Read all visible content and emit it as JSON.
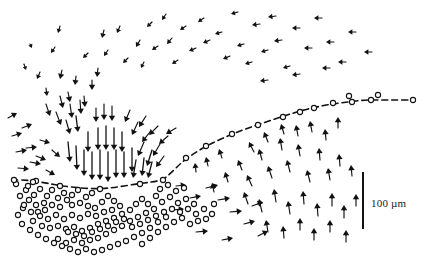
{
  "figure": {
    "kind": "vector-field-diagram",
    "background_color": "#ffffff",
    "ink_color": "#111111",
    "width": 425,
    "height": 275
  },
  "scale_bar": {
    "label": "100 µm",
    "value": 100,
    "unit": "µm",
    "orientation": "vertical",
    "x": 363,
    "y_top": 172,
    "y_bottom": 229,
    "thickness": 2,
    "label_x": 371,
    "label_y": 205,
    "color": "#111111"
  },
  "dashed_curve": {
    "name": "boundary-curve",
    "stroke": "#111111",
    "stroke_width": 1.6,
    "dash_pattern": "6 4",
    "points": [
      [
        12,
        180
      ],
      [
        28,
        180
      ],
      [
        46,
        183
      ],
      [
        62,
        186
      ],
      [
        80,
        188
      ],
      [
        100,
        189
      ],
      [
        118,
        187
      ],
      [
        136,
        184
      ],
      [
        152,
        182
      ],
      [
        163,
        180
      ],
      [
        172,
        172
      ],
      [
        182,
        162
      ],
      [
        196,
        152
      ],
      [
        212,
        143
      ],
      [
        230,
        135
      ],
      [
        248,
        128
      ],
      [
        266,
        122
      ],
      [
        284,
        116
      ],
      [
        300,
        111
      ],
      [
        316,
        107
      ],
      [
        332,
        104
      ],
      [
        348,
        102
      ],
      [
        364,
        100
      ],
      [
        380,
        100
      ],
      [
        396,
        100
      ],
      [
        414,
        100
      ]
    ]
  },
  "circles": {
    "name": "cell-markers",
    "stroke": "#111111",
    "stroke_width": 1.1,
    "fill": "#ffffff",
    "radius": 2.6,
    "count": 132,
    "on_curve": [
      [
        14,
        180
      ],
      [
        33,
        182
      ],
      [
        60,
        186
      ],
      [
        100,
        189
      ],
      [
        140,
        184
      ],
      [
        163,
        180
      ],
      [
        186,
        158
      ],
      [
        206,
        146
      ],
      [
        232,
        134
      ],
      [
        258,
        125
      ],
      [
        283,
        117
      ],
      [
        300,
        112
      ],
      [
        314,
        108
      ],
      [
        333,
        103
      ],
      [
        349,
        96
      ],
      [
        352,
        102
      ],
      [
        371,
        100
      ],
      [
        378,
        95
      ],
      [
        413,
        100
      ]
    ],
    "cluster": [
      [
        16,
        184
      ],
      [
        26,
        190
      ],
      [
        34,
        195
      ],
      [
        40,
        189
      ],
      [
        47,
        196
      ],
      [
        52,
        190
      ],
      [
        58,
        198
      ],
      [
        44,
        203
      ],
      [
        36,
        205
      ],
      [
        29,
        200
      ],
      [
        23,
        208
      ],
      [
        31,
        212
      ],
      [
        38,
        212
      ],
      [
        45,
        210
      ],
      [
        52,
        205
      ],
      [
        60,
        207
      ],
      [
        67,
        200
      ],
      [
        64,
        193
      ],
      [
        72,
        195
      ],
      [
        78,
        190
      ],
      [
        72,
        205
      ],
      [
        80,
        203
      ],
      [
        86,
        197
      ],
      [
        92,
        193
      ],
      [
        88,
        206
      ],
      [
        95,
        208
      ],
      [
        102,
        202
      ],
      [
        108,
        196
      ],
      [
        114,
        201
      ],
      [
        120,
        206
      ],
      [
        112,
        210
      ],
      [
        104,
        212
      ],
      [
        96,
        216
      ],
      [
        88,
        214
      ],
      [
        80,
        218
      ],
      [
        72,
        215
      ],
      [
        64,
        219
      ],
      [
        56,
        215
      ],
      [
        48,
        219
      ],
      [
        40,
        216
      ],
      [
        33,
        221
      ],
      [
        42,
        226
      ],
      [
        50,
        228
      ],
      [
        58,
        226
      ],
      [
        66,
        229
      ],
      [
        74,
        227
      ],
      [
        82,
        231
      ],
      [
        90,
        228
      ],
      [
        98,
        224
      ],
      [
        106,
        221
      ],
      [
        114,
        218
      ],
      [
        122,
        214
      ],
      [
        130,
        210
      ],
      [
        136,
        204
      ],
      [
        142,
        199
      ],
      [
        148,
        204
      ],
      [
        154,
        209
      ],
      [
        146,
        213
      ],
      [
        138,
        217
      ],
      [
        130,
        221
      ],
      [
        122,
        226
      ],
      [
        114,
        230
      ],
      [
        106,
        234
      ],
      [
        98,
        238
      ],
      [
        90,
        240
      ],
      [
        82,
        243
      ],
      [
        74,
        240
      ],
      [
        66,
        243
      ],
      [
        58,
        239
      ],
      [
        68,
        232
      ],
      [
        76,
        234
      ],
      [
        84,
        236
      ],
      [
        92,
        232
      ],
      [
        100,
        229
      ],
      [
        108,
        226
      ],
      [
        116,
        222
      ],
      [
        124,
        219
      ],
      [
        132,
        227
      ],
      [
        140,
        224
      ],
      [
        148,
        220
      ],
      [
        156,
        216
      ],
      [
        164,
        212
      ],
      [
        158,
        222
      ],
      [
        150,
        228
      ],
      [
        142,
        233
      ],
      [
        134,
        237
      ],
      [
        126,
        241
      ],
      [
        118,
        244
      ],
      [
        110,
        247
      ],
      [
        102,
        250
      ],
      [
        94,
        252
      ],
      [
        86,
        249
      ],
      [
        78,
        252
      ],
      [
        70,
        249
      ],
      [
        62,
        246
      ],
      [
        54,
        243
      ],
      [
        46,
        239
      ],
      [
        38,
        235
      ],
      [
        30,
        230
      ],
      [
        22,
        224
      ],
      [
        18,
        215
      ],
      [
        24,
        205
      ],
      [
        20,
        196
      ],
      [
        28,
        186
      ],
      [
        36,
        181
      ],
      [
        156,
        196
      ],
      [
        162,
        202
      ],
      [
        170,
        197
      ],
      [
        178,
        203
      ],
      [
        186,
        199
      ],
      [
        194,
        204
      ],
      [
        172,
        209
      ],
      [
        180,
        212
      ],
      [
        188,
        209
      ],
      [
        166,
        217
      ],
      [
        174,
        222
      ],
      [
        182,
        218
      ],
      [
        196,
        214
      ],
      [
        204,
        209
      ],
      [
        212,
        214
      ],
      [
        190,
        224
      ],
      [
        198,
        221
      ],
      [
        158,
        232
      ],
      [
        150,
        238
      ],
      [
        142,
        244
      ],
      [
        166,
        227
      ],
      [
        206,
        219
      ],
      [
        214,
        204
      ],
      [
        160,
        189
      ],
      [
        168,
        185
      ],
      [
        176,
        191
      ],
      [
        184,
        188
      ]
    ]
  },
  "arrows": {
    "name": "velocity-vectors",
    "stroke": "#111111",
    "head_style": "solid-triangle",
    "description": "Convergent flow field: long downward arrows in the upper-centre, short left-pointing arrows across the top, right-pointing arrows along the left edge and bottom-centre, and up/up-left arrows in the lower-right region.",
    "vectors": [
      [
        30,
        44,
        2,
        4
      ],
      [
        55,
        47,
        -4,
        6
      ],
      [
        60,
        26,
        -2,
        7
      ],
      [
        88,
        53,
        -5,
        5
      ],
      [
        104,
        30,
        -2,
        8
      ],
      [
        108,
        50,
        -4,
        6
      ],
      [
        120,
        26,
        -3,
        7
      ],
      [
        128,
        58,
        -5,
        5
      ],
      [
        140,
        40,
        -4,
        7
      ],
      [
        144,
        62,
        -3,
        6
      ],
      [
        152,
        22,
        -5,
        5
      ],
      [
        158,
        46,
        -6,
        4
      ],
      [
        166,
        14,
        -4,
        6
      ],
      [
        172,
        38,
        -5,
        6
      ],
      [
        178,
        60,
        -6,
        4
      ],
      [
        186,
        26,
        -6,
        4
      ],
      [
        196,
        48,
        -7,
        3
      ],
      [
        204,
        18,
        -6,
        4
      ],
      [
        210,
        40,
        -7,
        3
      ],
      [
        222,
        32,
        -7,
        2
      ],
      [
        230,
        56,
        -7,
        3
      ],
      [
        238,
        12,
        -7,
        2
      ],
      [
        244,
        44,
        -7,
        2
      ],
      [
        252,
        62,
        -7,
        2
      ],
      [
        260,
        24,
        -8,
        1
      ],
      [
        268,
        50,
        -7,
        2
      ],
      [
        276,
        16,
        -8,
        1
      ],
      [
        282,
        40,
        -8,
        1
      ],
      [
        290,
        66,
        -7,
        2
      ],
      [
        300,
        28,
        -8,
        0
      ],
      [
        312,
        48,
        -8,
        0
      ],
      [
        322,
        18,
        -8,
        0
      ],
      [
        334,
        42,
        -8,
        0
      ],
      [
        346,
        62,
        -8,
        0
      ],
      [
        356,
        32,
        -8,
        0
      ],
      [
        372,
        52,
        -8,
        0
      ],
      [
        268,
        80,
        -8,
        1
      ],
      [
        300,
        74,
        -8,
        1
      ],
      [
        330,
        68,
        -8,
        0
      ],
      [
        24,
        64,
        2,
        6
      ],
      [
        40,
        72,
        -3,
        7
      ],
      [
        46,
        88,
        1,
        8
      ],
      [
        62,
        70,
        -2,
        9
      ],
      [
        68,
        92,
        2,
        10
      ],
      [
        76,
        76,
        -1,
        9
      ],
      [
        84,
        96,
        1,
        11
      ],
      [
        92,
        80,
        0,
        10
      ],
      [
        98,
        68,
        -1,
        9
      ],
      [
        8,
        118,
        9,
        -5
      ],
      [
        12,
        136,
        10,
        -3
      ],
      [
        22,
        128,
        10,
        -4
      ],
      [
        16,
        152,
        11,
        -2
      ],
      [
        26,
        148,
        11,
        -1
      ],
      [
        18,
        168,
        11,
        1
      ],
      [
        30,
        162,
        11,
        2
      ],
      [
        40,
        140,
        10,
        3
      ],
      [
        36,
        156,
        10,
        4
      ],
      [
        46,
        170,
        9,
        5
      ],
      [
        52,
        150,
        8,
        7
      ],
      [
        46,
        104,
        4,
        12
      ],
      [
        56,
        112,
        5,
        13
      ],
      [
        60,
        96,
        3,
        12
      ],
      [
        66,
        120,
        4,
        14
      ],
      [
        70,
        104,
        2,
        14
      ],
      [
        76,
        116,
        2,
        16
      ],
      [
        80,
        100,
        1,
        14
      ],
      [
        96,
        108,
        0,
        14
      ],
      [
        104,
        104,
        0,
        16
      ],
      [
        112,
        106,
        0,
        15
      ],
      [
        98,
        128,
        0,
        22
      ],
      [
        106,
        126,
        0,
        24
      ],
      [
        114,
        128,
        0,
        22
      ],
      [
        88,
        132,
        0,
        20
      ],
      [
        122,
        132,
        0,
        20
      ],
      [
        84,
        150,
        0,
        26
      ],
      [
        92,
        152,
        0,
        28
      ],
      [
        100,
        150,
        0,
        30
      ],
      [
        108,
        152,
        0,
        30
      ],
      [
        116,
        150,
        0,
        28
      ],
      [
        124,
        152,
        0,
        26
      ],
      [
        132,
        148,
        0,
        24
      ],
      [
        76,
        146,
        1,
        24
      ],
      [
        68,
        142,
        2,
        20
      ],
      [
        130,
        110,
        -5,
        12
      ],
      [
        138,
        122,
        -6,
        13
      ],
      [
        146,
        116,
        -7,
        11
      ],
      [
        150,
        132,
        -8,
        10
      ],
      [
        158,
        126,
        -9,
        9
      ],
      [
        144,
        142,
        -6,
        14
      ],
      [
        152,
        150,
        -5,
        16
      ],
      [
        160,
        144,
        -7,
        12
      ],
      [
        136,
        160,
        -3,
        18
      ],
      [
        144,
        158,
        -2,
        18
      ],
      [
        152,
        162,
        -4,
        16
      ],
      [
        168,
        136,
        -9,
        8
      ],
      [
        176,
        128,
        -10,
        6
      ],
      [
        164,
        156,
        -8,
        11
      ],
      [
        176,
        186,
        10,
        -1
      ],
      [
        190,
        198,
        11,
        -2
      ],
      [
        172,
        210,
        12,
        -1
      ],
      [
        206,
        188,
        12,
        -3
      ],
      [
        218,
        200,
        12,
        -2
      ],
      [
        230,
        212,
        12,
        -1
      ],
      [
        244,
        224,
        11,
        -3
      ],
      [
        258,
        236,
        10,
        -5
      ],
      [
        196,
        232,
        12,
        -1
      ],
      [
        222,
        240,
        11,
        -2
      ],
      [
        252,
        206,
        11,
        -4
      ],
      [
        242,
        170,
        -4,
        -10
      ],
      [
        252,
        186,
        -5,
        -11
      ],
      [
        262,
        160,
        -3,
        -11
      ],
      [
        272,
        178,
        -4,
        -12
      ],
      [
        282,
        150,
        -2,
        -12
      ],
      [
        290,
        172,
        -3,
        -12
      ],
      [
        300,
        156,
        -2,
        -12
      ],
      [
        310,
        182,
        -3,
        -12
      ],
      [
        320,
        160,
        -1,
        -12
      ],
      [
        330,
        180,
        -2,
        -12
      ],
      [
        340,
        166,
        -1,
        -12
      ],
      [
        254,
        152,
        -5,
        -10
      ],
      [
        268,
        142,
        -4,
        -10
      ],
      [
        284,
        134,
        -3,
        -10
      ],
      [
        298,
        136,
        -2,
        -11
      ],
      [
        312,
        132,
        -2,
        -11
      ],
      [
        326,
        140,
        -1,
        -11
      ],
      [
        338,
        128,
        0,
        -11
      ],
      [
        248,
        204,
        -4,
        -12
      ],
      [
        262,
        212,
        -3,
        -13
      ],
      [
        276,
        202,
        -2,
        -13
      ],
      [
        290,
        214,
        -2,
        -13
      ],
      [
        304,
        204,
        -1,
        -13
      ],
      [
        318,
        216,
        -1,
        -13
      ],
      [
        332,
        206,
        0,
        -13
      ],
      [
        344,
        218,
        0,
        -13
      ],
      [
        268,
        232,
        -2,
        -12
      ],
      [
        284,
        238,
        -1,
        -12
      ],
      [
        300,
        230,
        0,
        -12
      ],
      [
        314,
        240,
        0,
        -12
      ],
      [
        330,
        232,
        0,
        -12
      ],
      [
        346,
        242,
        0,
        -12
      ],
      [
        356,
        206,
        0,
        -12
      ],
      [
        352,
        176,
        -1,
        -11
      ],
      [
        208,
        166,
        -2,
        -9
      ],
      [
        222,
        158,
        -3,
        -9
      ],
      [
        196,
        172,
        -1,
        -9
      ],
      [
        228,
        182,
        -3,
        -10
      ],
      [
        214,
        192,
        -2,
        -9
      ]
    ]
  }
}
